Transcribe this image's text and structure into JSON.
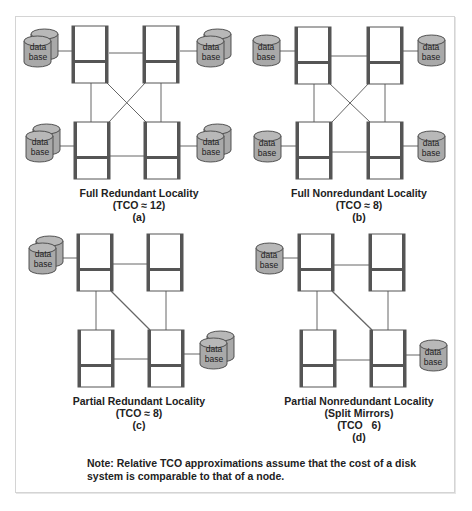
{
  "figure": {
    "panels": [
      {
        "id": "a",
        "title": "Full Redundant Locality",
        "tco": "(TCO ≈ 12)",
        "label": "(a)",
        "database_type": "redundant",
        "databases": 4,
        "nodes": 4,
        "links": [
          "top-left—top-right",
          "bottom-left—bottom-right",
          "top-left—bottom-left",
          "top-right—bottom-right",
          "top-left—bottom-right",
          "top-right—bottom-left"
        ]
      },
      {
        "id": "b",
        "title": "Full Nonredundant Locality",
        "tco": "(TCO ≈ 8)",
        "label": "(b)",
        "database_type": "single",
        "databases": 4,
        "nodes": 4,
        "links": [
          "top-left—top-right",
          "bottom-left—bottom-right",
          "top-left—bottom-left",
          "top-right—bottom-right",
          "top-left—bottom-right",
          "top-right—bottom-left"
        ]
      },
      {
        "id": "c",
        "title": "Partial Redundant Locality",
        "tco": "(TCO ≈ 8)",
        "label": "(c)",
        "database_type": "redundant",
        "databases": 2,
        "nodes": 4,
        "links": [
          "top-left—top-right",
          "bottom-left—bottom-right",
          "top-left—bottom-left",
          "top-right—bottom-right",
          "top-left—bottom-right"
        ]
      },
      {
        "id": "d",
        "title": "Partial Nonredundant Locality",
        "subtitle": "(Split Mirrors)",
        "tco": "(TCO   6)",
        "label": "(d)",
        "database_type": "single",
        "databases": 2,
        "nodes": 4,
        "links": [
          "top-left—top-right",
          "bottom-left—bottom-right",
          "top-left—bottom-left",
          "top-right—bottom-right",
          "top-left—bottom-right"
        ]
      }
    ],
    "database_label_line1": "data",
    "database_label_line2": "base",
    "note_line1": "Note: Relative TCO approximations assume that the cost of a disk",
    "note_line2": "system is comparable to that of a node.",
    "colors": {
      "node_border": "#555555",
      "node_fill": "#ffffff",
      "database_fill": "#a9a9a9",
      "link": "#666666",
      "frame": "#d4d4d4"
    }
  }
}
